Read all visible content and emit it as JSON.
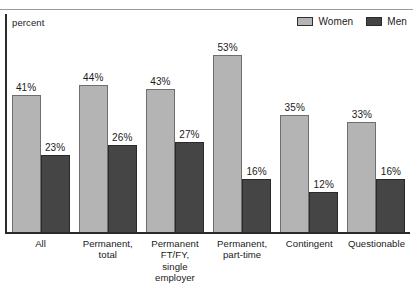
{
  "axis_unit_label": "percent",
  "legend": {
    "position": "top-right",
    "items": [
      {
        "label": "Women",
        "color": "#b4b4b4",
        "name": "women"
      },
      {
        "label": "Men",
        "color": "#454545",
        "name": "men"
      }
    ]
  },
  "colors": {
    "women_fill": "#b4b4b4",
    "women_border": "#6e6e6e",
    "men_fill": "#454545",
    "men_border": "#2a2a2a",
    "axis": "#2b2b2b",
    "text": "#1a1a1a",
    "background": "#ffffff"
  },
  "chart_data": {
    "type": "bar",
    "title": "",
    "subtitle": "",
    "xlabel": "",
    "ylabel": "percent",
    "ylim": [
      0,
      60
    ],
    "grid": false,
    "legend_position": "top-right",
    "categories": [
      "All",
      "Permanent,\ntotal",
      "Permanent\nFT/FY,\nsingle employer",
      "Permanent,\npart-time",
      "Contingent",
      "Questionable"
    ],
    "series": [
      {
        "name": "Women",
        "color": "#b4b4b4",
        "values": [
          41,
          44,
          43,
          53,
          35,
          33
        ],
        "labels": [
          "41%",
          "44%",
          "43%",
          "53%",
          "35%",
          "33%"
        ]
      },
      {
        "name": "Men",
        "color": "#454545",
        "values": [
          23,
          26,
          27,
          16,
          12,
          16
        ],
        "labels": [
          "23%",
          "26%",
          "27%",
          "16%",
          "12%",
          "16%"
        ]
      }
    ]
  }
}
